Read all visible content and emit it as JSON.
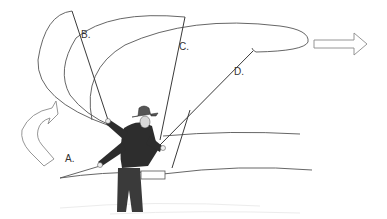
{
  "figure": {
    "labels": {
      "a": "A.",
      "b": "B.",
      "c": "C.",
      "d": "D."
    },
    "arrows": {
      "back_cast": "curved-up-arrow",
      "forward_cast": "right-arrow"
    },
    "colors": {
      "line": "#444444",
      "arrow_stroke": "#888888",
      "figure_dark": "#2a2a2a",
      "background": "#ffffff"
    }
  }
}
